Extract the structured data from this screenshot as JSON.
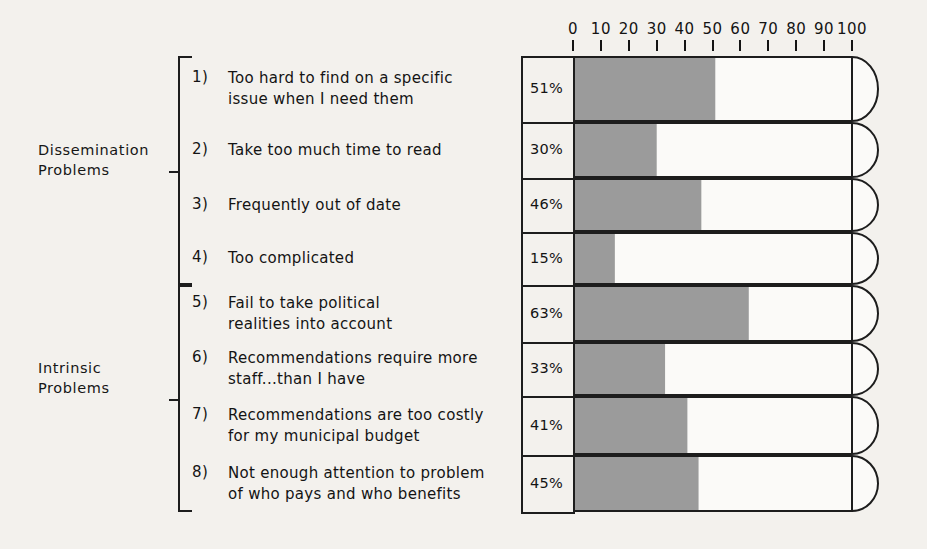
{
  "chart_data": {
    "type": "bar",
    "orientation": "horizontal",
    "title": "",
    "xlabel": "",
    "ylabel": "",
    "xlim": [
      0,
      100
    ],
    "grid": false,
    "legend": false,
    "axis_ticks": [
      0,
      10,
      20,
      30,
      40,
      50,
      60,
      70,
      80,
      90,
      100
    ],
    "axis_tick_labels": [
      "0",
      "10",
      "20",
      "30",
      "40",
      "50",
      "60",
      "70",
      "80",
      "90",
      "100"
    ],
    "categories": [
      "Too hard to find on a specific issue when I need them",
      "Take too much time to read",
      "Frequently out of date",
      "Too complicated",
      "Fail to take political realities into account",
      "Recommendations require more staff...than I have",
      "Recommendations are too costly for my municipal budget",
      "Not enough attention to problem of who pays and who benefits"
    ],
    "values": [
      51,
      30,
      46,
      15,
      63,
      33,
      41,
      45
    ],
    "value_labels": [
      "51%",
      "30%",
      "46%",
      "15%",
      "63%",
      "33%",
      "41%",
      "45%"
    ],
    "groups": [
      {
        "name": "Dissemination Problems",
        "items": [
          1,
          2,
          3,
          4
        ]
      },
      {
        "name": "Intrinsic Problems",
        "items": [
          5,
          6,
          7,
          8
        ]
      }
    ]
  },
  "colors": {
    "ink": "#1d1d1d",
    "paper": "#f3f1ed",
    "bar_fill": "#9b9b9b",
    "bar_empty": "#fbfaf8"
  },
  "groups": [
    {
      "label": "Dissemination\nProblems"
    },
    {
      "label": "Intrinsic\nProblems"
    }
  ],
  "rows": [
    {
      "num": "1)",
      "text": "Too hard to find on a specific\nissue when I need them",
      "pct": "51%",
      "value": 51
    },
    {
      "num": "2)",
      "text": "Take too much time to read",
      "pct": "30%",
      "value": 30
    },
    {
      "num": "3)",
      "text": "Frequently out of date",
      "pct": "46%",
      "value": 46
    },
    {
      "num": "4)",
      "text": "Too complicated",
      "pct": "15%",
      "value": 15
    },
    {
      "num": "5)",
      "text": "Fail to take political\nrealities into account",
      "pct": "63%",
      "value": 63
    },
    {
      "num": "6)",
      "text": "Recommendations require more\nstaff...than I have",
      "pct": "33%",
      "value": 33
    },
    {
      "num": "7)",
      "text": "Recommendations are too costly\nfor my municipal budget",
      "pct": "41%",
      "value": 41
    },
    {
      "num": "8)",
      "text": "Not enough attention to problem\nof who pays and who benefits",
      "pct": "45%",
      "value": 45
    }
  ],
  "axis": {
    "labels": [
      "0",
      "10",
      "20",
      "30",
      "40",
      "50",
      "60",
      "70",
      "80",
      "90",
      "100"
    ]
  }
}
